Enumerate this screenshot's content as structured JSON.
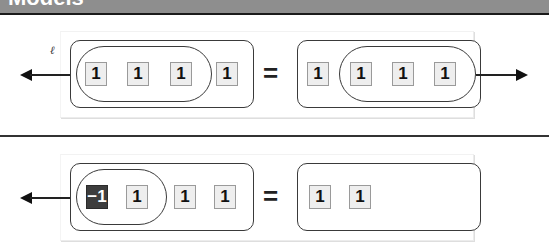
{
  "header": {
    "title": "Models",
    "background": "#8e8e8e"
  },
  "colors": {
    "tile_fill": "#eeeeee",
    "negative_tile_fill": "#3d3d3d",
    "outline": "#3a3a3a"
  },
  "models": [
    {
      "left": {
        "arrow_label": "ℓ",
        "arrow_direction": "left",
        "grouped_tiles": [
          "1",
          "1",
          "1"
        ],
        "other_tiles": [
          "1"
        ]
      },
      "equals": "=",
      "right": {
        "arrow_direction": "right",
        "other_tiles": [
          "1"
        ],
        "grouped_tiles": [
          "1",
          "1",
          "1"
        ]
      }
    },
    {
      "left": {
        "arrow_direction": "left",
        "grouped_tiles": [
          "−1",
          "1"
        ],
        "other_tiles": [
          "1",
          "1"
        ]
      },
      "equals": "=",
      "right": {
        "tiles": [
          "1",
          "1"
        ]
      }
    }
  ]
}
